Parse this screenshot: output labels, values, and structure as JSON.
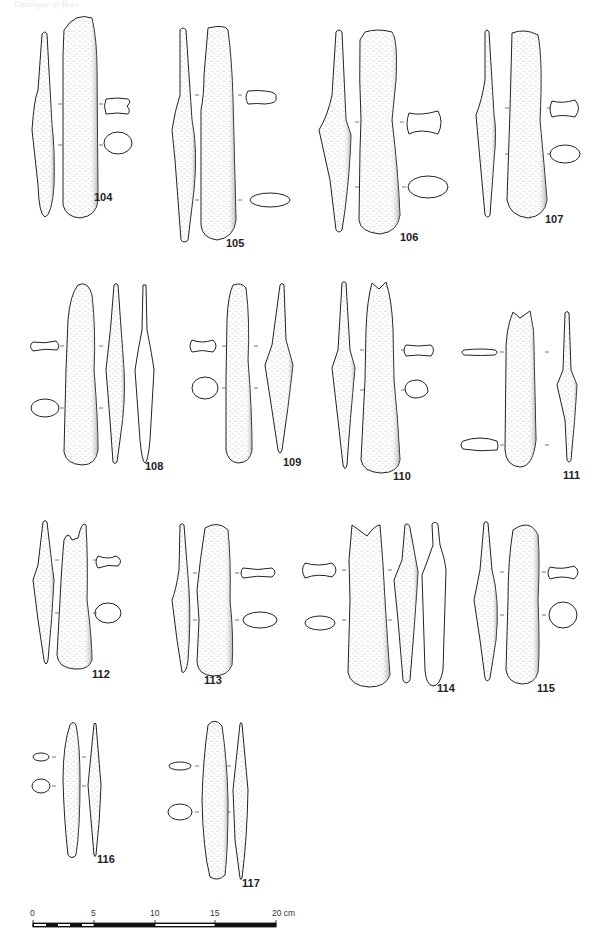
{
  "header": {
    "running_title": "Catalogue of Hoes"
  },
  "plate": {
    "artifacts": [
      {
        "id": "104",
        "label": "104"
      },
      {
        "id": "105",
        "label": "105"
      },
      {
        "id": "106",
        "label": "106"
      },
      {
        "id": "107",
        "label": "107"
      },
      {
        "id": "108",
        "label": "108"
      },
      {
        "id": "109",
        "label": "109"
      },
      {
        "id": "110",
        "label": "110"
      },
      {
        "id": "111",
        "label": "111"
      },
      {
        "id": "112",
        "label": "112"
      },
      {
        "id": "113",
        "label": "113"
      },
      {
        "id": "114",
        "label": "114"
      },
      {
        "id": "115",
        "label": "115"
      },
      {
        "id": "116",
        "label": "116"
      },
      {
        "id": "117",
        "label": "117"
      }
    ]
  },
  "scale_bar": {
    "ticks": [
      "0",
      "5",
      "10",
      "15",
      "20 cm"
    ],
    "unit": "cm",
    "max": 20
  },
  "colors": {
    "ink": "#222222",
    "shade": "#9a9a9a",
    "paper": "#ffffff"
  }
}
